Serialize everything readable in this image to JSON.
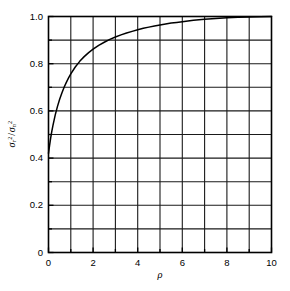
{
  "chart_data": {
    "type": "line",
    "title": "",
    "xlabel": "ρ",
    "ylabel": "σr²/σn²",
    "xlim": [
      0,
      10
    ],
    "ylim": [
      0,
      1.0
    ],
    "grid": true,
    "legend": "none",
    "x_major_ticks": [
      0,
      2,
      4,
      6,
      8,
      10
    ],
    "x_minor_ticks": [
      1,
      3,
      5,
      7,
      9
    ],
    "x_tick_labels": [
      "0",
      "2",
      "4",
      "6",
      "8",
      "10"
    ],
    "y_major_ticks": [
      0,
      0.2,
      0.4,
      0.6,
      0.8,
      1.0
    ],
    "y_minor_ticks": [
      0.1,
      0.3,
      0.5,
      0.7,
      0.9
    ],
    "y_tick_labels": [
      "0",
      "0.2",
      "0.4",
      "0.6",
      "0.8",
      "1.0"
    ],
    "x_gridlines": [
      0,
      1,
      2,
      3,
      4,
      5,
      6,
      7,
      8,
      9,
      10
    ],
    "y_gridlines": [
      0,
      0.1,
      0.2,
      0.3,
      0.4,
      0.5,
      0.6,
      0.7,
      0.8,
      0.9,
      1.0
    ],
    "series": [
      {
        "name": "variance ratio",
        "color": "#000000",
        "x": [
          0.0,
          0.05,
          0.1,
          0.15,
          0.2,
          0.3,
          0.4,
          0.5,
          0.6,
          0.7,
          0.8,
          0.9,
          1.0,
          1.2,
          1.4,
          1.6,
          1.8,
          2.0,
          2.25,
          2.5,
          2.75,
          3.0,
          3.25,
          3.5,
          3.75,
          4.0,
          4.25,
          4.5,
          4.75,
          5.0,
          5.25,
          5.5,
          5.75,
          6.0,
          6.25,
          6.5,
          6.75,
          7.0,
          7.5,
          8.0,
          8.5,
          9.0,
          9.5,
          10.0
        ],
        "y": [
          0.42,
          0.455,
          0.487,
          0.514,
          0.539,
          0.582,
          0.618,
          0.649,
          0.676,
          0.7,
          0.721,
          0.74,
          0.757,
          0.786,
          0.81,
          0.83,
          0.847,
          0.862,
          0.878,
          0.891,
          0.903,
          0.913,
          0.922,
          0.93,
          0.937,
          0.944,
          0.95,
          0.955,
          0.96,
          0.964,
          0.968,
          0.972,
          0.975,
          0.978,
          0.981,
          0.984,
          0.986,
          0.988,
          0.992,
          0.995,
          0.997,
          0.998,
          0.999,
          1.0
        ]
      }
    ],
    "axis_color": "#000000",
    "grid_color": "#1a1a1a",
    "background": "#ffffff"
  },
  "axes": {
    "x_title": "ρ",
    "y_title_num_sym": "σ",
    "y_title_num_sub": "r",
    "y_title_den_sym": "σ",
    "y_title_den_sub": "n",
    "y_title_exp": "2"
  }
}
